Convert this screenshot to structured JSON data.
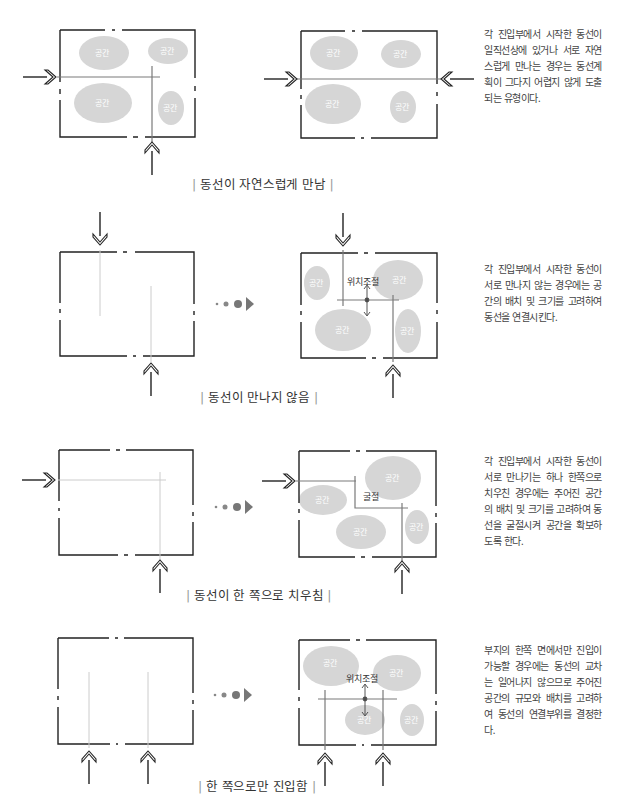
{
  "colors": {
    "wall": "#222222",
    "space_blob": "#d6d6d6",
    "circulation_line": "#7a7a7a",
    "faint_line": "#cccccc",
    "progress_marker": "#777777"
  },
  "space_label": "공간",
  "panels": [
    {
      "id": "natural-meet",
      "caption": "동선이 자연스럽게 만남",
      "description": "각 진입부에서 시작한 동선이 일직선상에 있거나 서로 자연스럽게 만나는 경우는 동선계획이 그다지 어렵지 않게 도출되는 유형이다."
    },
    {
      "id": "not-meeting",
      "caption": "동선이 만나지 않음",
      "description": "각 진입부에서 시작한 동선이 서로 만나지 않는 경우에는 공간의 배치 및 크기를 고려하여 동선을 연결시킨다.",
      "annotation": "위치조절"
    },
    {
      "id": "biased",
      "caption": "동선이 한 쪽으로 치우침",
      "description": "각 진입부에서 시작한 동선이 서로 만나기는 하나 한쪽으로 치우친 경우에는 주어진 공간의 배치 및 크기를 고려하여 동선을 굴절시켜 공간을 확보하도록 한다.",
      "annotation": "굴절"
    },
    {
      "id": "single-side",
      "caption": "한 쪽으로만 진입함",
      "description": "부지의 한쪽 면에서만 진입이 가능할 경우에는 동선의 교차는 일어나지 않으므로 주어진 공간의 규모와 배치를 고려하여 동선의 연결부위를 결정한다.",
      "annotation": "위치조절"
    }
  ],
  "icons": {
    "entry_arrow": "double-chevron-arrow",
    "transition": "dots-to-triangle"
  }
}
